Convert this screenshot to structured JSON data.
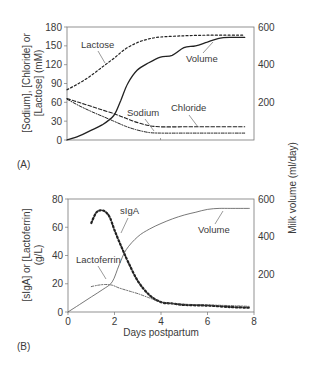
{
  "chart_data": [
    {
      "panel": "(A)",
      "type": "line",
      "xlabel": "",
      "xlim": [
        0,
        8
      ],
      "ylabel": "[Sodium], [Chloride] or [Lactose] (mM)",
      "ylabel_lines": [
        "[Sodium], [Chloride] or",
        "[Lactose] (mM)"
      ],
      "ylim": [
        0,
        180
      ],
      "yticks": [
        0,
        30,
        60,
        90,
        120,
        150,
        180
      ],
      "y2label": "Milk volume (ml/day)",
      "y2lim": [
        0,
        600
      ],
      "y2ticks": [
        200,
        400,
        600
      ],
      "grid": false,
      "series": [
        {
          "name": "Lactose",
          "axis": "left",
          "style": "dotted",
          "x": [
            0,
            0.5,
            1,
            1.5,
            2,
            2.5,
            3,
            3.5,
            4,
            5,
            6,
            7,
            7.6
          ],
          "y": [
            80,
            90,
            102,
            116,
            130,
            145,
            155,
            161,
            164,
            166,
            167,
            167,
            167
          ]
        },
        {
          "name": "Volume",
          "axis": "right",
          "style": "solid",
          "x": [
            0,
            0.5,
            1,
            1.5,
            2,
            2.3,
            2.6,
            3,
            3.5,
            4,
            4.5,
            5,
            5.5,
            6,
            6.5,
            7,
            7.6
          ],
          "y": [
            0,
            20,
            50,
            80,
            130,
            210,
            300,
            370,
            410,
            440,
            450,
            490,
            500,
            520,
            540,
            545,
            545
          ]
        },
        {
          "name": "Sodium",
          "axis": "left",
          "style": "dash-dot",
          "x": [
            0,
            0.5,
            1,
            1.5,
            2,
            2.5,
            3,
            3.5,
            4,
            5,
            6,
            7,
            7.6
          ],
          "y": [
            65,
            55,
            46,
            38,
            30,
            22,
            16,
            12,
            11,
            11,
            11,
            11,
            11
          ]
        },
        {
          "name": "Chloride",
          "axis": "left",
          "style": "dashed",
          "x": [
            0,
            0.5,
            1,
            1.5,
            2,
            2.5,
            3,
            3.5,
            4,
            5,
            6,
            7,
            7.6
          ],
          "y": [
            66,
            60,
            54,
            48,
            42,
            35,
            28,
            23,
            21,
            21,
            21,
            21,
            21
          ]
        }
      ],
      "annotations": [
        {
          "text": "Lactose"
        },
        {
          "text": "Volume"
        },
        {
          "text": "Sodium"
        },
        {
          "text": "Chloride"
        }
      ]
    },
    {
      "panel": "(B)",
      "type": "line",
      "xlabel": "Days postpartum",
      "xlim": [
        0,
        8
      ],
      "xticks": [
        0,
        2,
        4,
        6,
        8
      ],
      "ylabel": "[sIgA] or [Lactoferrin] (g/L)",
      "ylabel_lines": [
        "[sIgA] or [Lactoferrin]",
        "(g/L)"
      ],
      "ylim": [
        0,
        80
      ],
      "yticks": [
        0,
        20,
        40,
        60,
        80
      ],
      "y2label": "Milk volume (ml/day)",
      "y2lim": [
        0,
        600
      ],
      "y2ticks": [
        200,
        400,
        600
      ],
      "grid": false,
      "series": [
        {
          "name": "sIgA",
          "axis": "left",
          "style": "dotted-bold",
          "x": [
            1,
            1.2,
            1.4,
            1.6,
            1.8,
            2,
            2.3,
            2.6,
            3,
            3.5,
            4,
            4.5,
            5,
            6,
            7,
            7.8
          ],
          "y": [
            63,
            70,
            72,
            71,
            67,
            58,
            46,
            35,
            22,
            12,
            7,
            6,
            5,
            4.5,
            3.5,
            3
          ]
        },
        {
          "name": "Lactoferrin",
          "axis": "left",
          "style": "dash-dot-thin",
          "x": [
            1,
            1.3,
            1.6,
            1.9,
            2.2,
            2.6,
            3,
            3.5,
            4,
            4.5,
            5,
            6,
            7,
            7.8
          ],
          "y": [
            18,
            19,
            19.5,
            19,
            17,
            15,
            13,
            10,
            7,
            6,
            5.5,
            5,
            4.5,
            4
          ]
        },
        {
          "name": "Volume",
          "axis": "right",
          "style": "solid-thin",
          "x": [
            0,
            0.5,
            1,
            1.5,
            1.9,
            2.2,
            2.5,
            3,
            3.5,
            4,
            4.5,
            5,
            5.5,
            6,
            6.5,
            7,
            7.8
          ],
          "y": [
            0,
            40,
            80,
            120,
            160,
            250,
            330,
            400,
            440,
            470,
            495,
            515,
            530,
            545,
            550,
            550,
            550
          ]
        }
      ],
      "annotations": [
        {
          "text": "sIgA"
        },
        {
          "text": "Lactoferrin"
        },
        {
          "text": "Volume"
        }
      ]
    }
  ],
  "labels": {
    "panel_a": "(A)",
    "panel_b": "(B)",
    "left_axis_a_line1": "[Sodium], [Chloride] or",
    "left_axis_a_line2": "[Lactose] (mM)",
    "left_axis_b_line1": "[sIgA] or [Lactoferrin]",
    "left_axis_b_line2": "(g/L)",
    "right_axis": "Milk volume (ml/day)",
    "x_axis": "Days postpartum",
    "lactose": "Lactose",
    "volume": "Volume",
    "sodium": "Sodium",
    "chloride": "Chloride",
    "siga": "sIgA",
    "lactoferrin": "Lactoferrin"
  }
}
